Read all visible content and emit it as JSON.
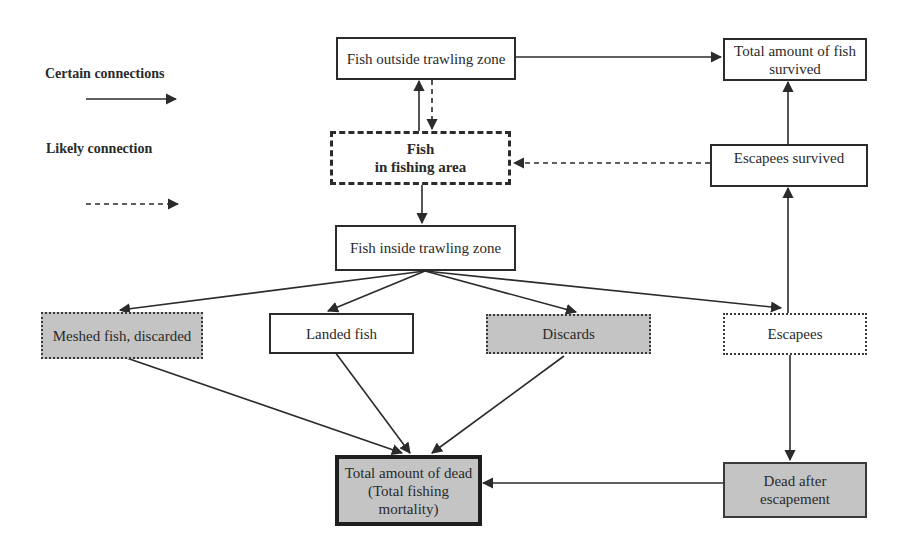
{
  "legend": {
    "certain_label": "Certain connections",
    "likely_label": "Likely connection"
  },
  "nodes": {
    "fish_outside": "Fish  outside trawling zone",
    "total_survived": "Total amount of fish survived",
    "fish_in_area_line1": "Fish",
    "fish_in_area_line2": "in fishing area",
    "escapees_survived": "Escapees survived",
    "fish_inside": "Fish inside trawling zone",
    "meshed": "Meshed fish, discarded",
    "landed": "Landed fish",
    "discards": "Discards",
    "escapees": "Escapees",
    "total_dead": "Total amount of   dead (Total fishing mortality)",
    "dead_after": "Dead after escapement"
  },
  "colors": {
    "line": "#2b2b2b",
    "grey_fill": "#c4c4c4",
    "white_fill": "#ffffff"
  },
  "edges": [
    {
      "from": "fish_outside",
      "to": "total_survived",
      "type": "certain"
    },
    {
      "from": "fish_in_area",
      "to": "fish_outside",
      "type": "certain"
    },
    {
      "from": "fish_outside",
      "to": "fish_in_area",
      "type": "likely"
    },
    {
      "from": "escapees_survived",
      "to": "fish_in_area",
      "type": "likely"
    },
    {
      "from": "escapees_survived",
      "to": "total_survived",
      "type": "certain"
    },
    {
      "from": "fish_in_area",
      "to": "fish_inside",
      "type": "certain"
    },
    {
      "from": "fish_inside",
      "to": "meshed",
      "type": "certain"
    },
    {
      "from": "fish_inside",
      "to": "landed",
      "type": "certain"
    },
    {
      "from": "fish_inside",
      "to": "discards",
      "type": "certain"
    },
    {
      "from": "fish_inside",
      "to": "escapees",
      "type": "certain"
    },
    {
      "from": "escapees",
      "to": "escapees_survived",
      "type": "certain"
    },
    {
      "from": "escapees",
      "to": "dead_after",
      "type": "certain"
    },
    {
      "from": "meshed",
      "to": "total_dead",
      "type": "certain"
    },
    {
      "from": "landed",
      "to": "total_dead",
      "type": "certain"
    },
    {
      "from": "discards",
      "to": "total_dead",
      "type": "certain"
    },
    {
      "from": "dead_after",
      "to": "total_dead",
      "type": "certain"
    }
  ]
}
